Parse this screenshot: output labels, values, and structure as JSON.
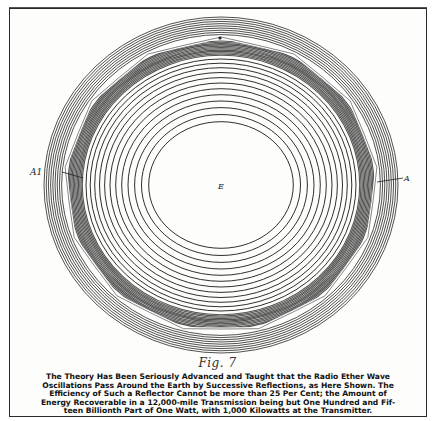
{
  "figure": {
    "label": "Fig. 7",
    "center_marker": "E",
    "left_marker": "A1",
    "right_marker": "A"
  },
  "caption": {
    "lines": [
      "The Theory Has Been Seriously Advanced and Taught that the Radio Ether Wave",
      "Oscillations Pass Around the Earth by Successive Reflections, as Here Shown.  The",
      "Efficiency of Such a Reflector Cannot be more than 25 Per Cent; the Amount of",
      "Energy Recoverable in a 12,000-mile Transmission being but One Hundred and Fif-",
      "teen Billionth Part of One Watt, with 1,000 Kilowatts at the Transmitter."
    ]
  },
  "colors": {
    "ink": "#1a1a1a",
    "paper": "#fdfdfb"
  }
}
